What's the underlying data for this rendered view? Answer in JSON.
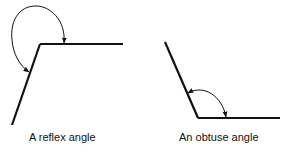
{
  "figures": [
    {
      "id": "reflex",
      "caption": "A reflex angle"
    },
    {
      "id": "obtuse",
      "caption": "An obtuse angle"
    }
  ],
  "colors": {
    "line": "#111111",
    "background": "#ffffff"
  }
}
